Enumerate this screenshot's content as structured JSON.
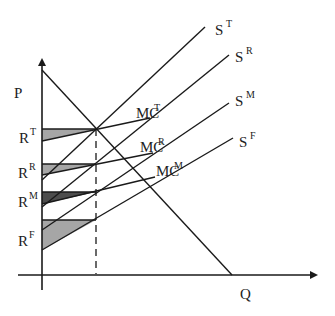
{
  "diagram": {
    "type": "supply-demand",
    "axes": {
      "y_label": "P",
      "x_label": "Q"
    },
    "demand_curve": {
      "name": "D"
    },
    "supply_curves": [
      {
        "id": "T",
        "label": "S",
        "superscript": "T"
      },
      {
        "id": "R",
        "label": "S",
        "superscript": "R"
      },
      {
        "id": "M",
        "label": "S",
        "superscript": "M"
      },
      {
        "id": "F",
        "label": "S",
        "superscript": "F"
      }
    ],
    "marginal_cost_curves": [
      {
        "id": "T",
        "label": "MC",
        "superscript": "T"
      },
      {
        "id": "R",
        "label": "MC",
        "superscript": "R"
      },
      {
        "id": "M",
        "label": "MC",
        "superscript": "M"
      }
    ],
    "price_levels": [
      {
        "id": "T",
        "label": "R",
        "superscript": "T"
      },
      {
        "id": "R",
        "label": "R",
        "superscript": "R"
      },
      {
        "id": "M",
        "label": "R",
        "superscript": "M"
      },
      {
        "id": "F",
        "label": "R",
        "superscript": "F"
      }
    ],
    "colors": {
      "line": "#1a1a1a",
      "shade_light": "#a6a6a6",
      "shade_dark": "#4d4d4d"
    }
  }
}
